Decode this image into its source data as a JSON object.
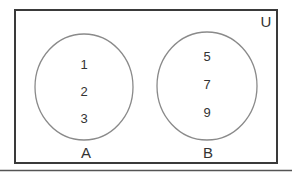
{
  "universe": {
    "label": "U",
    "border_color": "#3a3a3a"
  },
  "sets": [
    {
      "label": "A",
      "elements": [
        "1",
        "2",
        "3"
      ],
      "outline_color": "#8a8a8a"
    },
    {
      "label": "B",
      "elements": [
        "5",
        "7",
        "9"
      ],
      "outline_color": "#8a8a8a"
    }
  ],
  "bottom_rule_color": "#555555"
}
